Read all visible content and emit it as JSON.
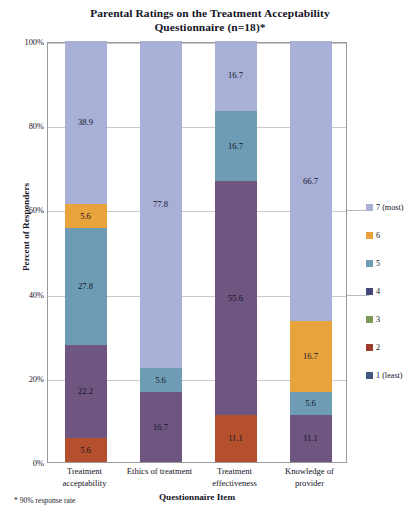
{
  "chart_data": {
    "type": "bar",
    "subtype": "stacked-100-percent",
    "title": "Parental Ratings on the Treatment Acceptability Questionnaire (n=18)*",
    "title_lines": [
      "Parental Ratings on the Treatment Acceptability",
      "Questionnaire (n=18)*"
    ],
    "xlabel": "Questionnaire Item",
    "ylabel": "Percent of Responders",
    "footnote": "* 90% response rate",
    "ylim": [
      0,
      100
    ],
    "yticks": [
      "0%",
      "20%",
      "40%",
      "60%",
      "80%",
      "100%"
    ],
    "ytick_values": [
      0,
      20,
      40,
      60,
      80,
      100
    ],
    "grid": true,
    "legend_position": "right",
    "categories": [
      "Treatment acceptability",
      "Ethics of treatment",
      "Treatment effectiveness",
      "Knowledge of provider"
    ],
    "category_lines": [
      [
        "Treatment",
        "acceptability"
      ],
      [
        "Ethics of treatment"
      ],
      [
        "Treatment",
        "effectiveness"
      ],
      [
        "Knowledge of",
        "provider"
      ]
    ],
    "series": [
      {
        "name": "1 (least)",
        "color": "#44577E",
        "values": [
          0,
          0,
          0,
          0
        ]
      },
      {
        "name": "2",
        "color": "#B5502F",
        "values": [
          5.6,
          0,
          11.1,
          0
        ]
      },
      {
        "name": "3",
        "color": "#7C9A56",
        "values": [
          0,
          0,
          0,
          0
        ]
      },
      {
        "name": "4",
        "color": "#6E5680",
        "values": [
          22.2,
          16.7,
          55.6,
          11.1
        ]
      },
      {
        "name": "5",
        "color": "#6E9CB5",
        "values": [
          27.8,
          5.6,
          16.7,
          5.6
        ]
      },
      {
        "name": "6",
        "color": "#E8A33D",
        "values": [
          5.6,
          0,
          0,
          16.7
        ]
      },
      {
        "name": "7 (most)",
        "color": "#A8B0D8",
        "values": [
          38.9,
          77.8,
          16.7,
          66.7
        ]
      }
    ],
    "legend_entries": [
      {
        "label": "7 (most)",
        "color": "#A8B0D8"
      },
      {
        "label": "6",
        "color": "#E8A33D"
      },
      {
        "label": "5",
        "color": "#6E9CB5"
      },
      {
        "label": "4",
        "color": "#44477A"
      },
      {
        "label": "3",
        "color": "#7C9A56"
      },
      {
        "label": "2",
        "color": "#9E3B2C"
      },
      {
        "label": "1 (least)",
        "color": "#44577E"
      }
    ]
  }
}
